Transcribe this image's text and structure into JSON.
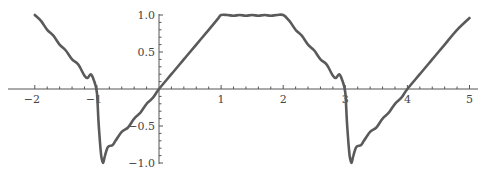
{
  "chart_data": {
    "type": "line",
    "title": "",
    "xlabel": "",
    "ylabel": "",
    "xlim": [
      -2.05,
      5.15
    ],
    "ylim": [
      -1.0,
      1.0
    ],
    "grid": false,
    "x_ticks": [
      -2,
      -1,
      1,
      2,
      3,
      4,
      5
    ],
    "x_tick_labels": [
      "−2",
      "−1",
      "1",
      "2",
      "3",
      "4",
      "5"
    ],
    "y_ticks": [
      1.0,
      0.5,
      -0.5,
      -1.0
    ],
    "y_tick_labels": [
      "1.0",
      "0.5",
      "−0.5",
      "−1.0"
    ],
    "series": [
      {
        "name": "f(x)",
        "color": "#5a5a5a",
        "x": [
          -2.0,
          -1.9,
          -1.8,
          -1.7,
          -1.6,
          -1.5,
          -1.4,
          -1.3,
          -1.2,
          -1.15,
          -1.1,
          -1.05,
          -1.0,
          -0.97,
          -0.93,
          -0.9,
          -0.87,
          -0.82,
          -0.75,
          -0.7,
          -0.6,
          -0.5,
          -0.4,
          -0.3,
          -0.2,
          -0.1,
          0.0,
          0.2,
          0.4,
          0.6,
          0.8,
          0.95,
          1.0,
          1.1,
          1.2,
          1.3,
          1.4,
          1.5,
          1.6,
          1.7,
          1.8,
          1.9,
          2.0,
          2.1,
          2.2,
          2.3,
          2.4,
          2.5,
          2.6,
          2.7,
          2.8,
          2.85,
          2.9,
          2.95,
          3.0,
          3.03,
          3.07,
          3.1,
          3.13,
          3.18,
          3.25,
          3.3,
          3.4,
          3.5,
          3.6,
          3.7,
          3.8,
          3.9,
          4.0,
          4.2,
          4.4,
          4.6,
          4.8,
          5.0
        ],
        "y": [
          1.0,
          0.92,
          0.8,
          0.72,
          0.6,
          0.52,
          0.4,
          0.33,
          0.18,
          0.15,
          0.2,
          0.12,
          -0.05,
          -0.5,
          -0.9,
          -1.0,
          -0.9,
          -0.78,
          -0.76,
          -0.7,
          -0.58,
          -0.52,
          -0.4,
          -0.32,
          -0.2,
          -0.12,
          0.0,
          0.2,
          0.4,
          0.6,
          0.8,
          0.95,
          1.0,
          1.0,
          0.99,
          1.0,
          0.99,
          1.0,
          0.99,
          1.0,
          0.99,
          1.0,
          1.0,
          0.92,
          0.8,
          0.72,
          0.6,
          0.52,
          0.4,
          0.33,
          0.18,
          0.15,
          0.2,
          0.12,
          -0.05,
          -0.5,
          -0.9,
          -1.0,
          -0.9,
          -0.78,
          -0.76,
          -0.7,
          -0.58,
          -0.52,
          -0.4,
          -0.32,
          -0.2,
          -0.12,
          0.0,
          0.2,
          0.4,
          0.6,
          0.8,
          0.96
        ]
      }
    ]
  }
}
